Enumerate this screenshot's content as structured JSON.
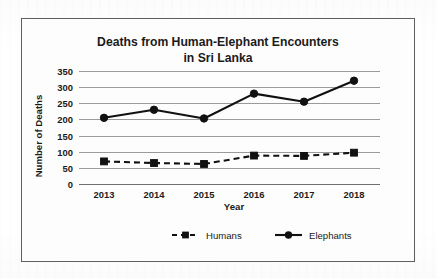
{
  "figure": {
    "border_color": "#5d5f61",
    "background": "#fdfdfd"
  },
  "chart_data": {
    "type": "line",
    "title": "Deaths from Human-Elephant Encounters in Sri Lanka",
    "title_line1": "Deaths from Human-Elephant Encounters",
    "title_line2": "in Sri Lanka",
    "xlabel": "Year",
    "ylabel": "Number of Deaths",
    "categories": [
      "2013",
      "2014",
      "2015",
      "2016",
      "2017",
      "2018"
    ],
    "x_tick_labels": [
      "2013",
      "2014",
      "2015",
      "2016",
      "2017",
      "2018"
    ],
    "y_tick_labels": [
      "0",
      "50",
      "100",
      "150",
      "200",
      "250",
      "300",
      "350"
    ],
    "ylim": [
      0,
      350
    ],
    "y_tick_step": 50,
    "grid": "horizontal",
    "legend_position": "bottom",
    "series": [
      {
        "name": "Humans",
        "values": [
          70,
          65,
          62,
          88,
          87,
          97
        ],
        "line_style": "dashed",
        "marker": "square",
        "color": "#111111"
      },
      {
        "name": "Elephants",
        "values": [
          205,
          230,
          203,
          280,
          255,
          320
        ],
        "line_style": "solid",
        "marker": "circle",
        "color": "#111111"
      }
    ]
  },
  "legend": {
    "items": [
      {
        "label": "Humans",
        "marker": "square-dashed-marker"
      },
      {
        "label": "Elephants",
        "marker": "circle-solid-marker"
      }
    ]
  }
}
